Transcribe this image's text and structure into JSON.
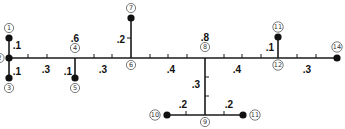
{
  "diagram": {
    "type": "weighted-tree",
    "nodes": [
      {
        "id": "1",
        "label": "1",
        "x": 9,
        "y": 38,
        "dot": true,
        "lx": 9,
        "ly": 28
      },
      {
        "id": "2",
        "label": "2",
        "x": 9,
        "y": 58,
        "dot": true,
        "lx": -0.5,
        "ly": 58
      },
      {
        "id": "3",
        "label": "3",
        "x": 9,
        "y": 78,
        "dot": true,
        "lx": 9,
        "ly": 88
      },
      {
        "id": "4",
        "label": "4",
        "x": 75,
        "y": 58,
        "dot": false,
        "lx": 75,
        "ly": 48
      },
      {
        "id": "5",
        "label": "5",
        "x": 75,
        "y": 78,
        "dot": true,
        "lx": 75,
        "ly": 88
      },
      {
        "id": "6",
        "label": "6",
        "x": 131,
        "y": 58,
        "dot": false,
        "lx": 131,
        "ly": 65
      },
      {
        "id": "7",
        "label": "7",
        "x": 131,
        "y": 18,
        "dot": true,
        "lx": 131,
        "ly": 8
      },
      {
        "id": "8",
        "label": "8",
        "x": 205,
        "y": 58,
        "dot": false,
        "lx": 205,
        "ly": 47
      },
      {
        "id": "9",
        "label": "9",
        "x": 205,
        "y": 115,
        "dot": false,
        "lx": 205,
        "ly": 122
      },
      {
        "id": "10",
        "label": "10",
        "x": 167,
        "y": 115,
        "dot": true,
        "lx": 155,
        "ly": 115
      },
      {
        "id": "11b",
        "label": "11",
        "x": 243,
        "y": 115,
        "dot": true,
        "lx": 255,
        "ly": 115
      },
      {
        "id": "11",
        "label": "11",
        "x": 278,
        "y": 37,
        "dot": true,
        "lx": 278,
        "ly": 27
      },
      {
        "id": "12",
        "label": "12",
        "x": 278,
        "y": 58,
        "dot": false,
        "lx": 278,
        "ly": 65
      },
      {
        "id": "14",
        "label": "14",
        "x": 337,
        "y": 58,
        "dot": true,
        "lx": 337,
        "ly": 47
      }
    ],
    "edges": [
      {
        "from": "1",
        "to": "2",
        "weight": ".1",
        "wx": 17,
        "wy": 45
      },
      {
        "from": "2",
        "to": "3",
        "weight": ".1",
        "wx": 17,
        "wy": 71
      },
      {
        "from": "2",
        "to": "4",
        "weight": ".3",
        "wx": 46,
        "wy": 69
      },
      {
        "from": "4",
        "to": "5",
        "weight": ".1",
        "wx": 68,
        "wy": 71
      },
      {
        "from": "4",
        "to": "6",
        "weight": ".3",
        "wx": 103,
        "wy": 69
      },
      {
        "from": "6",
        "to": "7",
        "weight": ".2",
        "wx": 121,
        "wy": 39
      },
      {
        "from": "6",
        "to": "8",
        "weight": ".4",
        "wx": 171,
        "wy": 69
      },
      {
        "from": "8",
        "to": "9",
        "weight": ".3",
        "wx": 196,
        "wy": 84
      },
      {
        "from": "10",
        "to": "9",
        "weight": ".2",
        "wx": 183,
        "wy": 104
      },
      {
        "from": "9",
        "to": "11b",
        "weight": ".2",
        "wx": 229,
        "wy": 104
      },
      {
        "from": "8",
        "to": "12",
        "weight": ".4",
        "wx": 237,
        "wy": 69
      },
      {
        "from": "12",
        "to": "11",
        "weight": ".1",
        "wx": 270,
        "wy": 47
      },
      {
        "from": "12",
        "to": "14",
        "weight": ".3",
        "wx": 307,
        "wy": 69
      }
    ],
    "node_values": [
      {
        "node": "4",
        "value": ".6",
        "x": 75,
        "y": 38
      },
      {
        "node": "8",
        "value": ".8",
        "x": 205,
        "y": 37
      }
    ],
    "ticks": {
      "horizontal_main_x": [
        28,
        47,
        94,
        112,
        150,
        168,
        187,
        224,
        242,
        261,
        297,
        316
      ],
      "main_y": 58,
      "vertical_8_9_y": [
        77,
        96
      ],
      "vertical_8_9_x": 205,
      "vertical_6_7_y": [
        38
      ],
      "vertical_6_7_x": 131,
      "bottom_x": [
        186,
        224
      ],
      "bottom_y": 115
    }
  }
}
